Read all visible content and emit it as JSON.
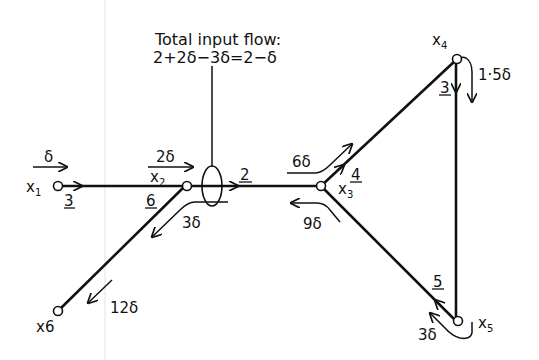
{
  "diagram": {
    "annotation": {
      "line1": "Total input flow:",
      "line2": "2+2δ−3δ=2−δ"
    },
    "nodes": [
      {
        "id": "x1",
        "label": "x",
        "sub": "1"
      },
      {
        "id": "x2",
        "label": "x",
        "sub": "2"
      },
      {
        "id": "x3",
        "label": "x",
        "sub": "3"
      },
      {
        "id": "x4",
        "label": "x",
        "sub": "4"
      },
      {
        "id": "x5",
        "label": "x",
        "sub": "5"
      },
      {
        "id": "x6",
        "label": "x6",
        "sub": ""
      }
    ],
    "edges": [
      {
        "from": "x1",
        "to": "x2",
        "capacity": "3"
      },
      {
        "from": "x2",
        "to": "x3",
        "capacity": "2"
      },
      {
        "from": "x2",
        "to": "x6",
        "capacity": "6"
      },
      {
        "from": "x3",
        "to": "x4",
        "capacity": "4"
      },
      {
        "from": "x4",
        "to": "x5",
        "capacity": "3"
      },
      {
        "from": "x5",
        "to": "x3",
        "capacity": "5"
      }
    ],
    "flows": {
      "into_x1": "δ",
      "into_x2": "2δ",
      "x2_to_x6": "3δ",
      "into_x6": "12δ",
      "x3_to_x4": "6δ",
      "x5_to_x3": "9δ",
      "x4_to_x5": "1·5δ",
      "out_of_x5": "3δ"
    }
  }
}
